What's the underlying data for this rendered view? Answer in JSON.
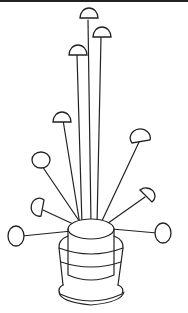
{
  "image": {
    "subject": "line drawing of pins with round heads stuck in a pincushion pot",
    "style": "black ink outline on white",
    "colors": {
      "ink": "#222222",
      "background": "#ffffff"
    },
    "pin_count": 10
  }
}
